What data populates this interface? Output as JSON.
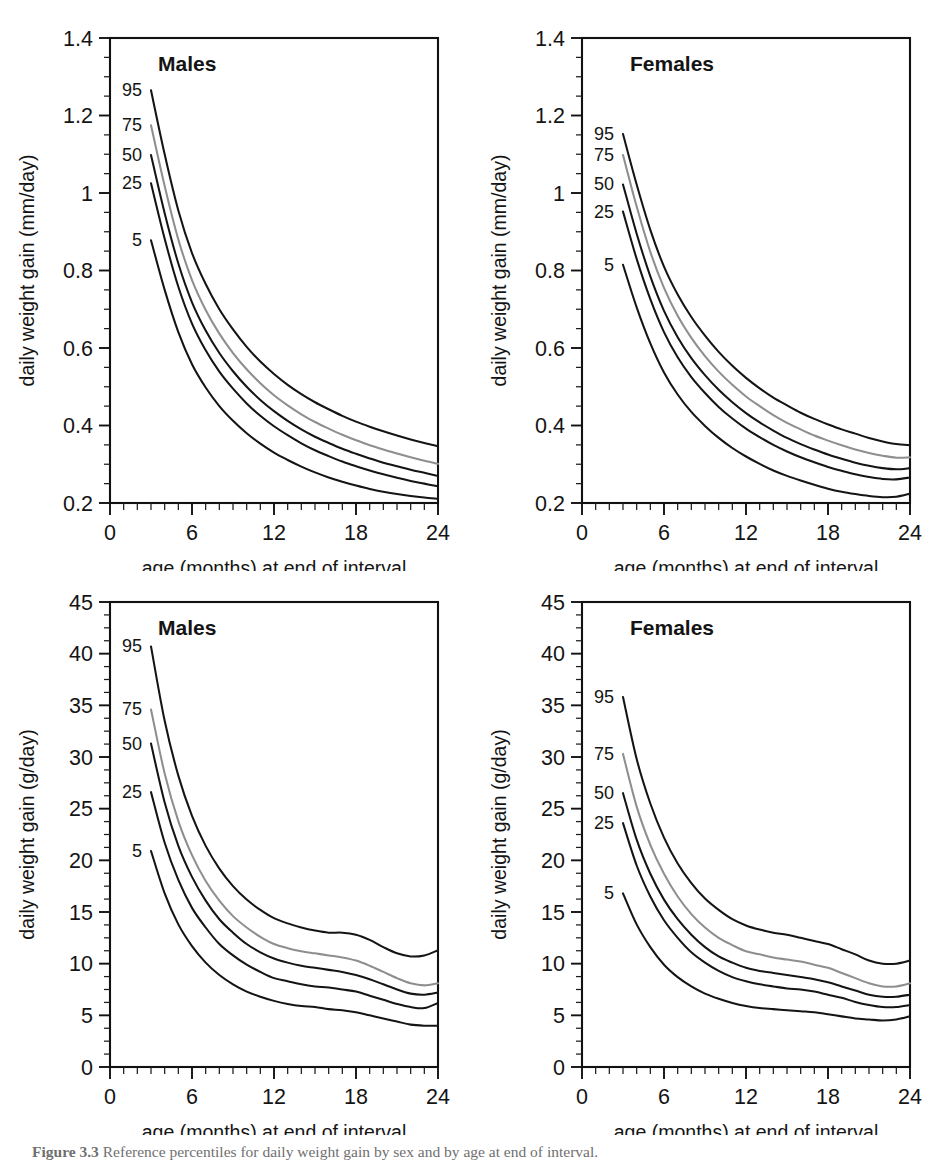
{
  "figure": {
    "caption_label": "Figure 3.3",
    "caption_text": "Reference percentiles for daily weight gain by sex and by age at end of interval."
  },
  "axes": {
    "xlabel": "age (months) at end of interval",
    "ylabel_mm": "daily weight gain (mm/day)",
    "ylabel_g": "daily weight gain (g/day)",
    "x_ticks": [
      "0",
      "6",
      "12",
      "18",
      "24"
    ],
    "y_ticks_mm": [
      "0.2",
      "0.4",
      "0.6",
      "0.8",
      "1",
      "1.2",
      "1.4"
    ],
    "y_ticks_g": [
      "0",
      "5",
      "10",
      "15",
      "20",
      "25",
      "30",
      "35",
      "40",
      "45"
    ]
  },
  "series_labels": [
    "95",
    "75",
    "50",
    "25",
    "5"
  ],
  "colors": {
    "line_dark": "#141414",
    "line_gray": "#8e8e8e",
    "axis": "#111111",
    "background": "#ffffff"
  },
  "chart_data": [
    {
      "type": "line",
      "panel_id": "top-left",
      "title": "Males",
      "xlabel": "age (months) at end of interval",
      "ylabel": "daily weight gain (mm/day)",
      "xlim": [
        0,
        24
      ],
      "ylim": [
        0.2,
        1.4
      ],
      "x_major_ticks": [
        0,
        6,
        12,
        18,
        24
      ],
      "y_major_ticks": [
        0.2,
        0.4,
        0.6,
        0.8,
        1.0,
        1.2,
        1.4
      ],
      "grid": false,
      "legend": "inline curve labels at left of each curve",
      "x": [
        3,
        4,
        5,
        6,
        7,
        8,
        9,
        10,
        11,
        12,
        13,
        14,
        15,
        16,
        17,
        18,
        19,
        20,
        21,
        22,
        23,
        24
      ],
      "series": [
        {
          "name": "95",
          "style": "dark",
          "values": [
            1.265,
            1.1,
            0.955,
            0.845,
            0.765,
            0.7,
            0.648,
            0.603,
            0.565,
            0.533,
            0.505,
            0.481,
            0.46,
            0.442,
            0.425,
            0.41,
            0.397,
            0.385,
            0.374,
            0.364,
            0.355,
            0.347
          ]
        },
        {
          "name": "75",
          "style": "gray",
          "values": [
            1.175,
            1.018,
            0.88,
            0.775,
            0.698,
            0.637,
            0.587,
            0.545,
            0.509,
            0.478,
            0.452,
            0.429,
            0.409,
            0.392,
            0.376,
            0.362,
            0.349,
            0.338,
            0.328,
            0.318,
            0.309,
            0.301
          ]
        },
        {
          "name": "50",
          "style": "dark",
          "values": [
            1.098,
            0.948,
            0.818,
            0.718,
            0.645,
            0.587,
            0.54,
            0.5,
            0.466,
            0.437,
            0.412,
            0.39,
            0.371,
            0.355,
            0.34,
            0.327,
            0.315,
            0.304,
            0.295,
            0.286,
            0.278,
            0.27
          ]
        },
        {
          "name": "25",
          "style": "dark",
          "values": [
            1.025,
            0.882,
            0.758,
            0.663,
            0.594,
            0.539,
            0.495,
            0.457,
            0.425,
            0.398,
            0.375,
            0.354,
            0.336,
            0.321,
            0.307,
            0.295,
            0.284,
            0.274,
            0.265,
            0.257,
            0.25,
            0.243
          ]
        },
        {
          "name": "5",
          "style": "dark",
          "values": [
            0.878,
            0.75,
            0.641,
            0.558,
            0.498,
            0.45,
            0.412,
            0.38,
            0.353,
            0.33,
            0.311,
            0.294,
            0.279,
            0.266,
            0.255,
            0.245,
            0.236,
            0.229,
            0.223,
            0.218,
            0.214,
            0.211
          ]
        }
      ]
    },
    {
      "type": "line",
      "panel_id": "top-right",
      "title": "Females",
      "xlabel": "age (months) at end of interval",
      "ylabel": "daily weight gain (mm/day)",
      "xlim": [
        0,
        24
      ],
      "ylim": [
        0.2,
        1.4
      ],
      "x_major_ticks": [
        0,
        6,
        12,
        18,
        24
      ],
      "y_major_ticks": [
        0.2,
        0.4,
        0.6,
        0.8,
        1.0,
        1.2,
        1.4
      ],
      "grid": false,
      "legend": "inline curve labels at left of each curve",
      "x": [
        3,
        4,
        5,
        6,
        7,
        8,
        9,
        10,
        11,
        12,
        13,
        14,
        15,
        16,
        17,
        18,
        19,
        20,
        21,
        22,
        23,
        24
      ],
      "series": [
        {
          "name": "95",
          "style": "dark",
          "values": [
            1.152,
            1.022,
            0.905,
            0.81,
            0.738,
            0.68,
            0.632,
            0.59,
            0.554,
            0.523,
            0.496,
            0.472,
            0.452,
            0.433,
            0.417,
            0.403,
            0.39,
            0.379,
            0.368,
            0.359,
            0.352,
            0.349
          ]
        },
        {
          "name": "75",
          "style": "gray",
          "values": [
            1.098,
            0.965,
            0.848,
            0.755,
            0.683,
            0.626,
            0.579,
            0.539,
            0.505,
            0.475,
            0.45,
            0.427,
            0.407,
            0.39,
            0.374,
            0.361,
            0.349,
            0.338,
            0.329,
            0.322,
            0.317,
            0.318
          ]
        },
        {
          "name": "50",
          "style": "dark",
          "values": [
            1.022,
            0.895,
            0.785,
            0.696,
            0.628,
            0.574,
            0.53,
            0.492,
            0.46,
            0.432,
            0.408,
            0.387,
            0.368,
            0.352,
            0.338,
            0.325,
            0.314,
            0.304,
            0.296,
            0.29,
            0.287,
            0.29
          ]
        },
        {
          "name": "25",
          "style": "dark",
          "values": [
            0.952,
            0.83,
            0.726,
            0.641,
            0.576,
            0.525,
            0.484,
            0.448,
            0.418,
            0.392,
            0.37,
            0.35,
            0.333,
            0.318,
            0.305,
            0.293,
            0.283,
            0.274,
            0.267,
            0.262,
            0.261,
            0.266
          ]
        },
        {
          "name": "5",
          "style": "dark",
          "values": [
            0.815,
            0.705,
            0.612,
            0.537,
            0.48,
            0.435,
            0.399,
            0.368,
            0.342,
            0.32,
            0.301,
            0.284,
            0.27,
            0.258,
            0.247,
            0.237,
            0.229,
            0.223,
            0.218,
            0.215,
            0.216,
            0.224
          ]
        }
      ]
    },
    {
      "type": "line",
      "panel_id": "bottom-left",
      "title": "Males",
      "xlabel": "age (months) at end of interval",
      "ylabel": "daily weight gain (g/day)",
      "xlim": [
        0,
        24
      ],
      "ylim": [
        0,
        45
      ],
      "x_major_ticks": [
        0,
        6,
        12,
        18,
        24
      ],
      "y_major_ticks": [
        0,
        5,
        10,
        15,
        20,
        25,
        30,
        35,
        40,
        45
      ],
      "grid": false,
      "legend": "inline curve labels at left of each curve",
      "x": [
        3,
        4,
        5,
        6,
        7,
        8,
        9,
        10,
        11,
        12,
        13,
        14,
        15,
        16,
        17,
        18,
        19,
        20,
        21,
        22,
        23,
        24
      ],
      "series": [
        {
          "name": "95",
          "style": "dark",
          "values": [
            40.7,
            33.5,
            28.2,
            24.3,
            21.4,
            19.2,
            17.5,
            16.2,
            15.2,
            14.4,
            13.9,
            13.5,
            13.2,
            13.0,
            13.0,
            12.8,
            12.3,
            11.6,
            11.0,
            10.7,
            10.8,
            11.3
          ]
        },
        {
          "name": "75",
          "style": "gray",
          "values": [
            34.6,
            28.4,
            23.8,
            20.5,
            18.0,
            16.1,
            14.6,
            13.5,
            12.6,
            11.9,
            11.5,
            11.2,
            11.0,
            10.8,
            10.6,
            10.3,
            9.8,
            9.2,
            8.6,
            8.1,
            7.9,
            8.1
          ]
        },
        {
          "name": "50",
          "style": "dark",
          "values": [
            31.3,
            25.6,
            21.4,
            18.4,
            16.1,
            14.3,
            13.0,
            11.9,
            11.1,
            10.5,
            10.1,
            9.8,
            9.6,
            9.4,
            9.2,
            8.9,
            8.5,
            8.0,
            7.5,
            7.1,
            7.0,
            7.2
          ]
        },
        {
          "name": "25",
          "style": "dark",
          "values": [
            26.6,
            21.7,
            18.1,
            15.4,
            13.5,
            11.9,
            10.8,
            9.9,
            9.2,
            8.6,
            8.3,
            8.0,
            7.8,
            7.7,
            7.5,
            7.3,
            6.9,
            6.5,
            6.1,
            5.8,
            5.7,
            6.2
          ]
        },
        {
          "name": "5",
          "style": "dark",
          "values": [
            20.9,
            16.8,
            13.8,
            11.7,
            10.1,
            8.9,
            8.0,
            7.3,
            6.8,
            6.4,
            6.1,
            5.9,
            5.8,
            5.6,
            5.5,
            5.3,
            5.0,
            4.7,
            4.4,
            4.1,
            4.0,
            4.0
          ]
        }
      ]
    },
    {
      "type": "line",
      "panel_id": "bottom-right",
      "title": "Females",
      "xlabel": "age (months) at end of interval",
      "ylabel": "daily weight gain (g/day)",
      "xlim": [
        0,
        45
      ],
      "ylim": [
        0,
        45
      ],
      "x_major_ticks": [
        0,
        6,
        12,
        18,
        24
      ],
      "y_major_ticks": [
        0,
        5,
        10,
        15,
        20,
        25,
        30,
        35,
        40,
        45
      ],
      "grid": false,
      "legend": "inline curve labels at left of each curve",
      "x": [
        3,
        4,
        5,
        6,
        7,
        8,
        9,
        10,
        11,
        12,
        13,
        14,
        15,
        16,
        17,
        18,
        19,
        20,
        21,
        22,
        23,
        24
      ],
      "series": [
        {
          "name": "95",
          "style": "dark",
          "values": [
            35.8,
            29.8,
            25.5,
            22.2,
            19.7,
            17.8,
            16.3,
            15.2,
            14.3,
            13.7,
            13.3,
            13.0,
            12.8,
            12.5,
            12.2,
            11.9,
            11.4,
            10.9,
            10.3,
            10.0,
            10.0,
            10.3
          ]
        },
        {
          "name": "75",
          "style": "gray",
          "values": [
            30.3,
            25.2,
            21.5,
            18.7,
            16.5,
            14.8,
            13.5,
            12.5,
            11.8,
            11.2,
            10.9,
            10.6,
            10.4,
            10.2,
            9.9,
            9.6,
            9.1,
            8.6,
            8.1,
            7.8,
            7.8,
            8.1
          ]
        },
        {
          "name": "50",
          "style": "dark",
          "values": [
            26.5,
            22.0,
            18.7,
            16.2,
            14.3,
            12.8,
            11.6,
            10.7,
            10.1,
            9.6,
            9.3,
            9.1,
            8.9,
            8.7,
            8.5,
            8.2,
            7.8,
            7.4,
            7.0,
            6.8,
            6.8,
            7.0
          ]
        },
        {
          "name": "25",
          "style": "dark",
          "values": [
            23.6,
            19.5,
            16.5,
            14.2,
            12.5,
            11.1,
            10.1,
            9.3,
            8.7,
            8.3,
            8.0,
            7.8,
            7.6,
            7.5,
            7.3,
            7.0,
            6.7,
            6.3,
            6.0,
            5.8,
            5.8,
            6.0
          ]
        },
        {
          "name": "5",
          "style": "dark",
          "values": [
            16.8,
            13.8,
            11.6,
            9.9,
            8.7,
            7.8,
            7.1,
            6.6,
            6.2,
            5.9,
            5.7,
            5.6,
            5.5,
            5.4,
            5.3,
            5.1,
            4.9,
            4.7,
            4.6,
            4.5,
            4.6,
            4.9
          ]
        }
      ]
    }
  ]
}
